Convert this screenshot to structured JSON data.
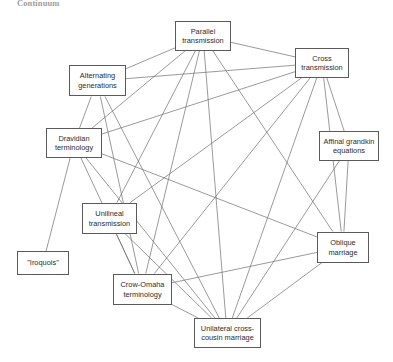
{
  "figure": {
    "caption": "Continuum",
    "background_color": "#ffffff",
    "node_border_color": "#5a5a5a",
    "edge_color": "#6f6f6f",
    "width": 393,
    "height": 362
  },
  "chart_data": {
    "type": "diagram",
    "title": "Continuum",
    "layout": "undirected network graph of kinship concepts",
    "nodes": [
      {
        "id": "parallel",
        "label": "Parallel\ntransmission",
        "x": 175,
        "y": 21,
        "w": 56,
        "h": 30,
        "cx": 203,
        "cy": 36
      },
      {
        "id": "cross",
        "label": "Cross\ntransmission",
        "x": 295,
        "y": 48,
        "w": 54,
        "h": 30,
        "cx": 322,
        "cy": 63
      },
      {
        "id": "alternating",
        "label": "Alternating\ngenerations",
        "x": 69,
        "y": 65,
        "w": 57,
        "h": 31,
        "cx": 97,
        "cy": 81
      },
      {
        "id": "dravidian",
        "label": "Dravidian\nterminology",
        "x": 46,
        "y": 128,
        "w": 56,
        "h": 30,
        "cx": 74,
        "cy": 143
      },
      {
        "id": "affinal",
        "label": "Affinal grandkin\nequations",
        "x": 319,
        "y": 131,
        "w": 60,
        "h": 30,
        "cx": 349,
        "cy": 146
      },
      {
        "id": "unilineal",
        "label": "Unilineal\ntransmission",
        "x": 82,
        "y": 203,
        "w": 55,
        "h": 31,
        "cx": 109,
        "cy": 218
      },
      {
        "id": "oblique",
        "label": "Oblique\nmarriage",
        "x": 317,
        "y": 232,
        "w": 52,
        "h": 31,
        "cx": 343,
        "cy": 247
      },
      {
        "id": "iroquois",
        "label": "\"Iroquois\"",
        "x": 17,
        "y": 251,
        "w": 52,
        "h": 24,
        "cx": 43,
        "cy": 263
      },
      {
        "id": "crowomaha",
        "label": "Crow-Omaha\nterminology",
        "x": 113,
        "y": 274,
        "w": 59,
        "h": 31,
        "cx": 142,
        "cy": 289
      },
      {
        "id": "unilateral",
        "label": "Unilateral cross-\ncousin marriage",
        "x": 194,
        "y": 318,
        "w": 67,
        "h": 30,
        "cx": 227,
        "cy": 333
      }
    ],
    "edges": [
      {
        "source": "parallel",
        "target": "cross"
      },
      {
        "source": "parallel",
        "target": "alternating"
      },
      {
        "source": "parallel",
        "target": "dravidian"
      },
      {
        "source": "parallel",
        "target": "unilineal"
      },
      {
        "source": "parallel",
        "target": "crowomaha"
      },
      {
        "source": "parallel",
        "target": "unilateral"
      },
      {
        "source": "parallel",
        "target": "oblique"
      },
      {
        "source": "cross",
        "target": "alternating"
      },
      {
        "source": "cross",
        "target": "dravidian"
      },
      {
        "source": "cross",
        "target": "affinal"
      },
      {
        "source": "cross",
        "target": "unilineal"
      },
      {
        "source": "cross",
        "target": "crowomaha"
      },
      {
        "source": "cross",
        "target": "unilateral"
      },
      {
        "source": "cross",
        "target": "oblique"
      },
      {
        "source": "alternating",
        "target": "dravidian"
      },
      {
        "source": "alternating",
        "target": "crowomaha"
      },
      {
        "source": "alternating",
        "target": "unilateral"
      },
      {
        "source": "dravidian",
        "target": "iroquois"
      },
      {
        "source": "dravidian",
        "target": "crowomaha"
      },
      {
        "source": "dravidian",
        "target": "unilateral"
      },
      {
        "source": "dravidian",
        "target": "oblique"
      },
      {
        "source": "affinal",
        "target": "oblique"
      },
      {
        "source": "affinal",
        "target": "unilateral"
      },
      {
        "source": "unilineal",
        "target": "crowomaha"
      },
      {
        "source": "unilineal",
        "target": "unilateral"
      },
      {
        "source": "crowomaha",
        "target": "unilateral"
      },
      {
        "source": "crowomaha",
        "target": "oblique"
      },
      {
        "source": "oblique",
        "target": "unilateral"
      }
    ]
  }
}
